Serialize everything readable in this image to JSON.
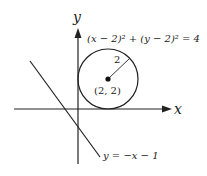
{
  "diagram": {
    "axes": {
      "x_label": "x",
      "y_label": "y"
    },
    "circle": {
      "equation": "(x − 2)² + (y − 2)² = 4",
      "center_label": "(2, 2)",
      "radius_label": "2",
      "center": [
        2,
        2
      ],
      "radius": 2
    },
    "line": {
      "equation": "y = −x − 1",
      "slope": -1,
      "intercept": -1
    },
    "colors": {
      "stroke": "#222222",
      "background": "#ffffff"
    }
  }
}
